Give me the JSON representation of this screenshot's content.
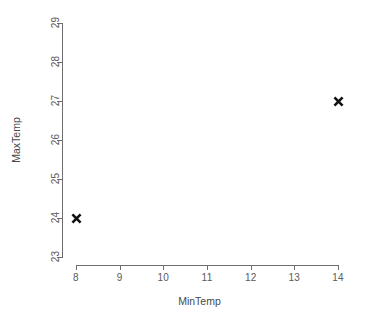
{
  "chart_data": {
    "type": "scatter",
    "title": "",
    "xlabel": "MinTemp",
    "ylabel": "MaxTemp",
    "xlim": [
      8,
      14
    ],
    "ylim": [
      23,
      29
    ],
    "x_ticks": [
      "8",
      "9",
      "10",
      "11",
      "12",
      "13",
      "14"
    ],
    "y_ticks": [
      "23",
      "24",
      "25",
      "26",
      "27",
      "28",
      "29"
    ],
    "grid": false,
    "legend": null,
    "marker": "x-cross",
    "marker_color": "#111111",
    "axis_color": "#6e6e6e",
    "background": "#ffffff",
    "points": [
      {
        "x": 8,
        "y": 24,
        "label": "(8, 24)"
      },
      {
        "x": 14,
        "y": 27,
        "label": "(14, 27)"
      }
    ],
    "series": [
      {
        "name": "MaxTemp vs MinTemp",
        "x": [
          8,
          14
        ],
        "y": [
          24,
          27
        ]
      }
    ]
  }
}
